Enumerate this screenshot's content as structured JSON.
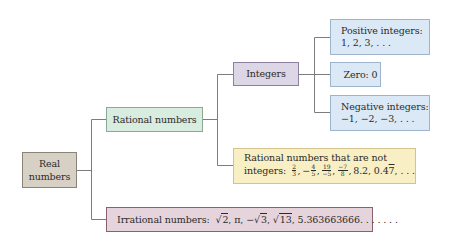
{
  "diagram": {
    "colors": {
      "real": "#d7d1c5",
      "rational": "#d8ecdf",
      "integers": "#ddd6e6",
      "integer_subsets": "#dbe8f5",
      "non_integer_rationals": "#f8efc4",
      "irrational": "#e6d4dc",
      "connector": "#7d7d7d"
    },
    "nodes": {
      "real": {
        "line1": "Real",
        "line2": "numbers"
      },
      "rational": {
        "label": "Rational numbers"
      },
      "integers": {
        "label": "Integers"
      },
      "positive": {
        "line1": "Positive integers:",
        "line2": "1, 2, 3, . . ."
      },
      "zero": {
        "label": "Zero: 0"
      },
      "negative": {
        "line1": "Negative integers:",
        "line2": "−1, −2, −3, . . ."
      },
      "non_integer_rationals": {
        "line1": "Rational numbers that are not",
        "prefix": "integers:",
        "fractions": [
          {
            "sign": "",
            "num": "2",
            "den": "3"
          },
          {
            "sign": "−",
            "num": "4",
            "den": "5"
          },
          {
            "sign": "",
            "num": "19",
            "den": "−5"
          },
          {
            "sign": "",
            "num": "−7",
            "den": "8"
          }
        ],
        "decimal1": "8.2,",
        "decimal2_base": "0.4",
        "decimal2_repeat": "7",
        "suffix": ", . . ."
      },
      "irrational": {
        "prefix": "Irrational numbers:",
        "items": [
          {
            "type": "sqrt",
            "sign": "",
            "radicand": "2"
          },
          {
            "type": "text",
            "value": "π"
          },
          {
            "type": "sqrt",
            "sign": "−",
            "radicand": "3"
          },
          {
            "type": "sqrt",
            "sign": "",
            "radicand": "13"
          }
        ],
        "tail": "5.363663666. . . . . . ."
      }
    }
  }
}
